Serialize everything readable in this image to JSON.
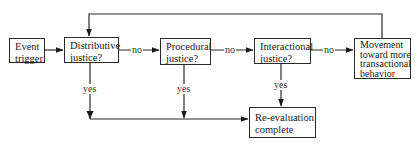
{
  "diagram": {
    "type": "flowchart",
    "nodes": {
      "event_trigger": {
        "lines": [
          "Event",
          "trigger"
        ]
      },
      "distributive": {
        "lines": [
          "Distributive",
          "justice?"
        ]
      },
      "procedural": {
        "lines": [
          "Procedural",
          "justice?"
        ]
      },
      "interactional": {
        "lines": [
          "Interactional",
          "justice?"
        ]
      },
      "movement": {
        "lines": [
          "Movement",
          "toward more",
          "transactional",
          "behavior"
        ]
      },
      "reevaluation": {
        "lines": [
          "Re-evaluation",
          "complete"
        ]
      }
    },
    "edge_labels": {
      "no_1": "no",
      "no_2": "no",
      "no_3": "no",
      "yes_1": "yes",
      "yes_2": "yes",
      "yes_3": "yes"
    },
    "edges": [
      {
        "from": "event_trigger",
        "to": "distributive",
        "label": ""
      },
      {
        "from": "distributive",
        "to": "procedural",
        "label": "no"
      },
      {
        "from": "procedural",
        "to": "interactional",
        "label": "no"
      },
      {
        "from": "interactional",
        "to": "movement",
        "label": "no"
      },
      {
        "from": "movement",
        "to": "distributive",
        "label": ""
      },
      {
        "from": "distributive",
        "to": "reevaluation",
        "label": "yes"
      },
      {
        "from": "procedural",
        "to": "reevaluation",
        "label": "yes"
      },
      {
        "from": "interactional",
        "to": "reevaluation",
        "label": "yes"
      }
    ],
    "colors": {
      "line": "#2a2a2a",
      "background": "#ffffff"
    }
  }
}
